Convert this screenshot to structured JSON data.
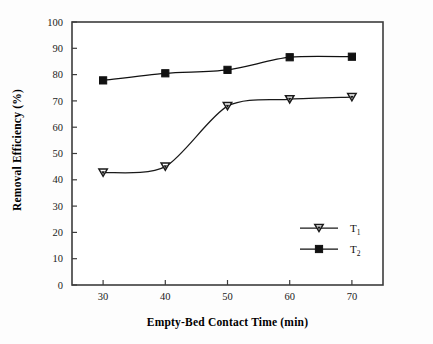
{
  "chart_data": {
    "type": "line",
    "title": "",
    "subtitle": "",
    "xlabel": "Empty-Bed Contact Time (min)",
    "ylabel": "Removal Efficiency (%)",
    "x": [
      30,
      40,
      50,
      60,
      70
    ],
    "xlim": [
      25,
      75
    ],
    "ylim": [
      0,
      100
    ],
    "xticks": [
      "30",
      "40",
      "50",
      "60",
      "70"
    ],
    "yticks": [
      "0",
      "10",
      "20",
      "30",
      "40",
      "50",
      "60",
      "70",
      "80",
      "90",
      "100"
    ],
    "grid": false,
    "legend_position": "lower-right-inside",
    "series": [
      {
        "name": "T1",
        "label_base": "T",
        "label_sub": "1",
        "marker": "triangle-down-open",
        "color": "#1a1a1a",
        "values": [
          42.7,
          45.0,
          68.0,
          70.6,
          71.4
        ]
      },
      {
        "name": "T2",
        "label_base": "T",
        "label_sub": "2",
        "marker": "square-filled",
        "color": "#111111",
        "values": [
          77.8,
          80.5,
          81.8,
          86.6,
          86.8
        ]
      }
    ]
  },
  "axes": {
    "ylabel": "Removal Efficiency (%)",
    "xlabel": "Empty-Bed Contact Time (min)"
  },
  "legend": {
    "items": [
      {
        "base": "T",
        "sub": "1"
      },
      {
        "base": "T",
        "sub": "2"
      }
    ]
  },
  "colors": {
    "axis": "#3c3c3c",
    "series1": "#1a1a1a",
    "series2": "#111111",
    "background": "#fdfdfd",
    "text": "#111111"
  }
}
